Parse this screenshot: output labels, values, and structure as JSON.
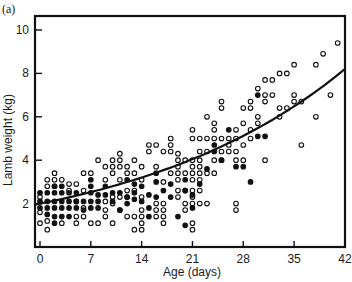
{
  "chart_data": {
    "type": "scatter",
    "panel_label": "(a)",
    "title": "",
    "xlabel": "Age (days)",
    "ylabel": "Lamb weight (kg)",
    "xlim": [
      -1,
      42.5
    ],
    "ylim": [
      0,
      10.6
    ],
    "x_ticks": [
      0,
      7,
      14,
      21,
      28,
      35,
      42
    ],
    "y_ticks": [
      2,
      4,
      6,
      8,
      10
    ],
    "grid": false,
    "legend": null,
    "fit_curve": {
      "type": "exponential",
      "points": [
        [
          0,
          2.0
        ],
        [
          7,
          2.4
        ],
        [
          14,
          2.95
        ],
        [
          21,
          3.75
        ],
        [
          28,
          4.9
        ],
        [
          35,
          6.3
        ],
        [
          42,
          8.2
        ]
      ]
    },
    "series": [
      {
        "name": "open",
        "marker": "open-circle",
        "points": [
          [
            0,
            1.1
          ],
          [
            0,
            1.6
          ],
          [
            0,
            2.3
          ],
          [
            1,
            0.8
          ],
          [
            1,
            1.2
          ],
          [
            1,
            2.8
          ],
          [
            1,
            3.1
          ],
          [
            2,
            3.1
          ],
          [
            2,
            3.4
          ],
          [
            2,
            2.8
          ],
          [
            3,
            1.1
          ],
          [
            3,
            3.1
          ],
          [
            4,
            2.6
          ],
          [
            4,
            2.9
          ],
          [
            5,
            1.1
          ],
          [
            5,
            1.4
          ],
          [
            5,
            2.1
          ],
          [
            5,
            2.9
          ],
          [
            6,
            1.4
          ],
          [
            6,
            1.8
          ],
          [
            6,
            2.6
          ],
          [
            6,
            3.4
          ],
          [
            7,
            1.1
          ],
          [
            7,
            3.4
          ],
          [
            8,
            1.1
          ],
          [
            8,
            4.0
          ],
          [
            9,
            1.4
          ],
          [
            9,
            1.7
          ],
          [
            9,
            2.1
          ],
          [
            9,
            3.1
          ],
          [
            9,
            3.7
          ],
          [
            10,
            1.1
          ],
          [
            10,
            2.0
          ],
          [
            10,
            2.3
          ],
          [
            10,
            3.4
          ],
          [
            10,
            3.7
          ],
          [
            10,
            4.0
          ],
          [
            11,
            1.7
          ],
          [
            11,
            2.3
          ],
          [
            11,
            3.1
          ],
          [
            11,
            3.7
          ],
          [
            11,
            4.0
          ],
          [
            11,
            4.3
          ],
          [
            12,
            1.4
          ],
          [
            12,
            2.3
          ],
          [
            12,
            2.6
          ],
          [
            12,
            3.4
          ],
          [
            12,
            3.7
          ],
          [
            13,
            0.8
          ],
          [
            13,
            1.4
          ],
          [
            13,
            2.6
          ],
          [
            13,
            3.4
          ],
          [
            13,
            4.0
          ],
          [
            14,
            0.8
          ],
          [
            14,
            1.1
          ],
          [
            14,
            1.4
          ],
          [
            14,
            1.7
          ],
          [
            14,
            2.3
          ],
          [
            14,
            3.1
          ],
          [
            14,
            3.7
          ],
          [
            15,
            4.4
          ],
          [
            15,
            4.7
          ],
          [
            16,
            1.4
          ],
          [
            16,
            1.7
          ],
          [
            16,
            2.0
          ],
          [
            16,
            3.7
          ],
          [
            16,
            4.7
          ],
          [
            17,
            1.1
          ],
          [
            17,
            1.4
          ],
          [
            17,
            1.7
          ],
          [
            17,
            2.0
          ],
          [
            17,
            3.0
          ],
          [
            17,
            4.4
          ],
          [
            18,
            3.4
          ],
          [
            18,
            4.4
          ],
          [
            18,
            4.7
          ],
          [
            18,
            5.0
          ],
          [
            19,
            2.3
          ],
          [
            19,
            2.6
          ],
          [
            19,
            3.1
          ],
          [
            19,
            3.4
          ],
          [
            19,
            3.7
          ],
          [
            19,
            4.0
          ],
          [
            19,
            4.3
          ],
          [
            20,
            1.7
          ],
          [
            20,
            2.0
          ],
          [
            20,
            2.6
          ],
          [
            20,
            3.4
          ],
          [
            20,
            4.0
          ],
          [
            21,
            0.8
          ],
          [
            21,
            1.1
          ],
          [
            21,
            2.0
          ],
          [
            21,
            2.3
          ],
          [
            21,
            2.6
          ],
          [
            21,
            3.1
          ],
          [
            21,
            3.4
          ],
          [
            21,
            3.7
          ],
          [
            21,
            4.0
          ],
          [
            21,
            5.0
          ],
          [
            21,
            5.4
          ],
          [
            22,
            2.0
          ],
          [
            22,
            2.6
          ],
          [
            22,
            3.1
          ],
          [
            22,
            3.4
          ],
          [
            22,
            3.7
          ],
          [
            22,
            4.0
          ],
          [
            22,
            4.4
          ],
          [
            22,
            5.0
          ],
          [
            23,
            2.0
          ],
          [
            23,
            3.4
          ],
          [
            23,
            4.4
          ],
          [
            23,
            5.0
          ],
          [
            23,
            6.0
          ],
          [
            24,
            3.4
          ],
          [
            24,
            4.0
          ],
          [
            24,
            5.0
          ],
          [
            24,
            5.4
          ],
          [
            24,
            5.7
          ],
          [
            25,
            4.0
          ],
          [
            25,
            4.4
          ],
          [
            25,
            5.0
          ],
          [
            25,
            6.4
          ],
          [
            25,
            6.7
          ],
          [
            26,
            4.4
          ],
          [
            26,
            4.7
          ],
          [
            26,
            5.0
          ],
          [
            27,
            1.7
          ],
          [
            27,
            2.0
          ],
          [
            27,
            4.0
          ],
          [
            27,
            4.4
          ],
          [
            27,
            5.0
          ],
          [
            27,
            5.4
          ],
          [
            28,
            4.0
          ],
          [
            28,
            4.7
          ],
          [
            28,
            5.7
          ],
          [
            28,
            6.4
          ],
          [
            29,
            5.0
          ],
          [
            29,
            5.4
          ],
          [
            29,
            6.4
          ],
          [
            29,
            6.7
          ],
          [
            30,
            5.7
          ],
          [
            30,
            6.0
          ],
          [
            30,
            7.3
          ],
          [
            31,
            6.7
          ],
          [
            31,
            7.0
          ],
          [
            31,
            7.7
          ],
          [
            31,
            4.0
          ],
          [
            32,
            7.0
          ],
          [
            32,
            7.7
          ],
          [
            33,
            6.0
          ],
          [
            33,
            6.4
          ],
          [
            33,
            8.0
          ],
          [
            34,
            8.0
          ],
          [
            34,
            6.4
          ],
          [
            35,
            6.7
          ],
          [
            35,
            7.0
          ],
          [
            35,
            8.4
          ],
          [
            36,
            4.7
          ],
          [
            36,
            6.7
          ],
          [
            38,
            6.0
          ],
          [
            38,
            8.4
          ],
          [
            39,
            8.9
          ],
          [
            40,
            7.0
          ],
          [
            41,
            9.4
          ]
        ]
      },
      {
        "name": "filled",
        "marker": "filled-circle",
        "points": [
          [
            0,
            1.8
          ],
          [
            0,
            2.1
          ],
          [
            0,
            2.5
          ],
          [
            1,
            1.5
          ],
          [
            1,
            1.8
          ],
          [
            1,
            2.1
          ],
          [
            1,
            2.5
          ],
          [
            2,
            1.1
          ],
          [
            2,
            1.4
          ],
          [
            2,
            1.8
          ],
          [
            2,
            2.1
          ],
          [
            2,
            2.5
          ],
          [
            2,
            2.8
          ],
          [
            3,
            1.4
          ],
          [
            3,
            1.8
          ],
          [
            3,
            2.1
          ],
          [
            3,
            2.5
          ],
          [
            3,
            2.8
          ],
          [
            4,
            1.4
          ],
          [
            4,
            1.8
          ],
          [
            4,
            2.1
          ],
          [
            4,
            2.5
          ],
          [
            5,
            1.8
          ],
          [
            5,
            2.1
          ],
          [
            5,
            2.5
          ],
          [
            6,
            1.7
          ],
          [
            6,
            2.1
          ],
          [
            7,
            1.8
          ],
          [
            7,
            2.1
          ],
          [
            7,
            2.5
          ],
          [
            7,
            2.8
          ],
          [
            7,
            3.1
          ],
          [
            8,
            1.8
          ],
          [
            8,
            2.1
          ],
          [
            8,
            2.4
          ],
          [
            9,
            2.4
          ],
          [
            9,
            2.8
          ],
          [
            10,
            2.1
          ],
          [
            10,
            2.5
          ],
          [
            11,
            1.7
          ],
          [
            11,
            2.5
          ],
          [
            12,
            2.0
          ],
          [
            12,
            2.3
          ],
          [
            12,
            3.1
          ],
          [
            13,
            2.2
          ],
          [
            13,
            2.5
          ],
          [
            13,
            2.9
          ],
          [
            14,
            2.1
          ],
          [
            14,
            2.8
          ],
          [
            15,
            1.4
          ],
          [
            15,
            1.8
          ],
          [
            15,
            2.4
          ],
          [
            16,
            2.3
          ],
          [
            16,
            3.0
          ],
          [
            16,
            3.4
          ],
          [
            17,
            2.6
          ],
          [
            18,
            2.3
          ],
          [
            18,
            2.9
          ],
          [
            19,
            1.4
          ],
          [
            20,
            1.0
          ],
          [
            20,
            2.6
          ],
          [
            20,
            3.1
          ],
          [
            21,
            1.8
          ],
          [
            21,
            2.4
          ],
          [
            22,
            2.9
          ],
          [
            23,
            3.6
          ],
          [
            24,
            4.4
          ],
          [
            24,
            4.7
          ],
          [
            25,
            4.0
          ],
          [
            26,
            5.4
          ],
          [
            27,
            3.7
          ],
          [
            28,
            3.7
          ],
          [
            29,
            3.0
          ],
          [
            30,
            7.0
          ],
          [
            30,
            5.1
          ],
          [
            31,
            5.1
          ]
        ]
      }
    ]
  }
}
